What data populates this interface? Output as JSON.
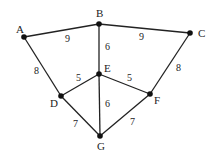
{
  "graph": {
    "nodes": [
      {
        "id": "A",
        "x": 24,
        "y": 37,
        "lx": 16,
        "ly": 33
      },
      {
        "id": "B",
        "x": 99,
        "y": 24,
        "lx": 96,
        "ly": 17
      },
      {
        "id": "C",
        "x": 190,
        "y": 33,
        "lx": 198,
        "ly": 37
      },
      {
        "id": "D",
        "x": 61,
        "y": 96,
        "lx": 50,
        "ly": 107
      },
      {
        "id": "E",
        "x": 99,
        "y": 74,
        "lx": 104,
        "ly": 72
      },
      {
        "id": "F",
        "x": 150,
        "y": 94,
        "lx": 154,
        "ly": 104
      },
      {
        "id": "G",
        "x": 100,
        "y": 136,
        "lx": 97,
        "ly": 150
      }
    ],
    "edges": [
      {
        "from": "A",
        "to": "B",
        "weight": "9",
        "lx": 65,
        "ly": 42
      },
      {
        "from": "B",
        "to": "C",
        "weight": "9",
        "lx": 139,
        "ly": 40
      },
      {
        "from": "B",
        "to": "E",
        "weight": "6",
        "lx": 105,
        "ly": 50
      },
      {
        "from": "A",
        "to": "D",
        "weight": "8",
        "lx": 34,
        "ly": 74
      },
      {
        "from": "C",
        "to": "F",
        "weight": "8",
        "lx": 176,
        "ly": 71
      },
      {
        "from": "D",
        "to": "E",
        "weight": "5",
        "lx": 76,
        "ly": 81
      },
      {
        "from": "E",
        "to": "F",
        "weight": "5",
        "lx": 127,
        "ly": 81
      },
      {
        "from": "E",
        "to": "G",
        "weight": "6",
        "lx": 105,
        "ly": 107
      },
      {
        "from": "D",
        "to": "G",
        "weight": "7",
        "lx": 73,
        "ly": 127
      },
      {
        "from": "F",
        "to": "G",
        "weight": "7",
        "lx": 130,
        "ly": 125
      }
    ]
  }
}
